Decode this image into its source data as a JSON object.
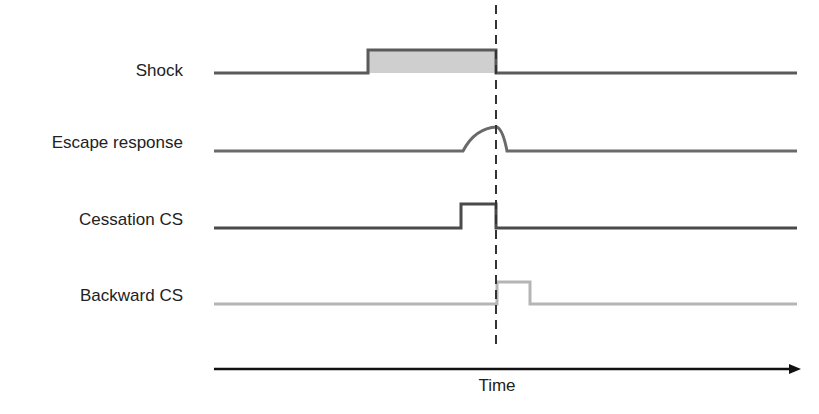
{
  "diagram": {
    "rows": [
      {
        "label": "Shock",
        "type": "pulse-filled",
        "color": "#5a5a5a",
        "fill": "#cfcfcf",
        "baseline_y": 73,
        "high_y": 50,
        "start_x": 368,
        "end_x": 496
      },
      {
        "label": "Escape response",
        "type": "bump",
        "color": "#6a6a6a",
        "baseline_y": 151,
        "peak_y": 127,
        "start_x": 463,
        "peak_x": 497,
        "end_x": 507
      },
      {
        "label": "Cessation CS",
        "type": "pulse",
        "color": "#4a4a4a",
        "baseline_y": 228,
        "high_y": 204,
        "start_x": 461,
        "end_x": 496
      },
      {
        "label": "Backward CS",
        "type": "pulse",
        "color": "#b5b5b5",
        "baseline_y": 304,
        "high_y": 282,
        "start_x": 497,
        "end_x": 530
      }
    ],
    "time_axis": {
      "label": "Time",
      "y": 369,
      "x_start": 214,
      "x_end": 797
    },
    "marker_line": {
      "x": 496,
      "style": "dashed",
      "color": "#333333"
    }
  }
}
